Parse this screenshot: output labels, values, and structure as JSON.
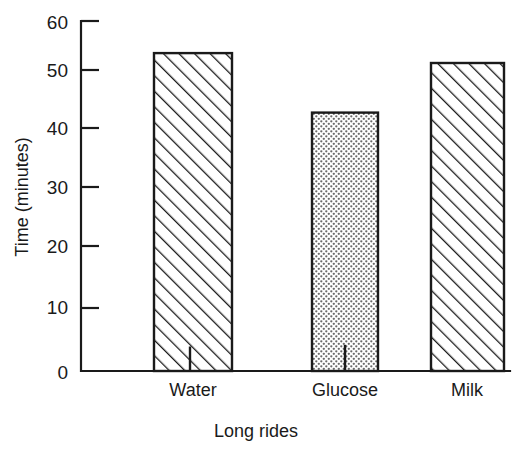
{
  "chart_data": {
    "type": "bar",
    "title": "",
    "subtitle": "",
    "categories": [
      "Water",
      "Glucose",
      "Milk"
    ],
    "values": [
      54.5,
      44.3,
      52.8
    ],
    "xlabel": "Long rides",
    "ylabel": "Time (minutes)",
    "ylim": [
      0,
      60
    ],
    "yticks": [
      0,
      10,
      20,
      30,
      40,
      50,
      60
    ],
    "ytick_labels": [
      "0",
      "10",
      "20",
      "30",
      "40",
      "50",
      "60"
    ],
    "grid": false,
    "legend": null,
    "series_fills": [
      "diagonal-hatch",
      "stipple-dots",
      "diagonal-hatch"
    ],
    "annotations": [
      {
        "category": "Water",
        "type": "inner-tick",
        "value": 4.2
      },
      {
        "category": "Glucose",
        "type": "inner-tick",
        "value": 4.5
      }
    ]
  },
  "axes": {
    "y_title": "Time (minutes)",
    "x_title": "Long rides",
    "y_ticks": [
      {
        "label": "60",
        "value": 60
      },
      {
        "label": "50",
        "value": 50
      },
      {
        "label": "40",
        "value": 40
      },
      {
        "label": "30",
        "value": 30
      },
      {
        "label": "20",
        "value": 20
      },
      {
        "label": "10",
        "value": 10
      },
      {
        "label": "0",
        "value": 0
      }
    ],
    "x_categories": [
      {
        "label": "Water"
      },
      {
        "label": "Glucose"
      },
      {
        "label": "Milk"
      }
    ]
  },
  "colors": {
    "ink": "#1a1a1a",
    "background": "#ffffff",
    "hatch": "#1a1a1a",
    "stipple": "#555555"
  }
}
